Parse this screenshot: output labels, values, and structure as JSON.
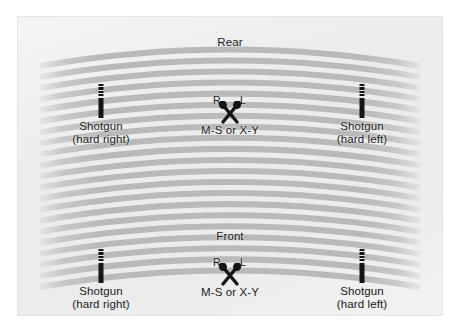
{
  "diagram": {
    "title_alt": "Stereo miking layout diagram",
    "orientation_labels": {
      "rear": "Rear",
      "front": "Front"
    },
    "channel_labels": {
      "right": "R",
      "left": "L"
    },
    "stereo_pair_label": "M-S or X-Y",
    "shotgun_label": "Shotgun",
    "shotgun_hard_right": "(hard right)",
    "shotgun_hard_left": "(hard left)",
    "colors": {
      "background": "#ffffff",
      "panel": "#ececec",
      "stripe": "#b9b9b9",
      "ink": "#1b1b1b"
    },
    "rear_section": {
      "orientation": "Rear",
      "mics": [
        {
          "type": "shotgun-mic",
          "name": "shotgun-mic-rear-left-position",
          "label": "Shotgun",
          "sublabel": "(hard right)"
        },
        {
          "type": "stereo-pair",
          "name": "stereo-pair-rear",
          "label": "M-S or X-Y",
          "left": "L",
          "right": "R"
        },
        {
          "type": "shotgun-mic",
          "name": "shotgun-mic-rear-right-position",
          "label": "Shotgun",
          "sublabel": "(hard left)"
        }
      ]
    },
    "front_section": {
      "orientation": "Front",
      "mics": [
        {
          "type": "shotgun-mic",
          "name": "shotgun-mic-front-left-position",
          "label": "Shotgun",
          "sublabel": "(hard right)"
        },
        {
          "type": "stereo-pair",
          "name": "stereo-pair-front",
          "label": "M-S or X-Y",
          "left": "L",
          "right": "R"
        },
        {
          "type": "shotgun-mic",
          "name": "shotgun-mic-front-right-position",
          "label": "Shotgun",
          "sublabel": "(hard left)"
        }
      ]
    }
  }
}
